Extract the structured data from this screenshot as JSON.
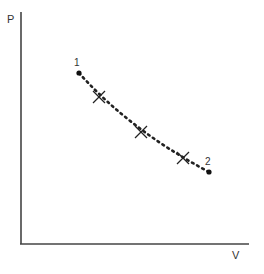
{
  "diagram": {
    "type": "PV diagram",
    "y_axis_label": "P",
    "x_axis_label": "V",
    "points": [
      {
        "label": "1",
        "x": 79,
        "y": 73
      },
      {
        "label": "2",
        "x": 209,
        "y": 172
      }
    ],
    "markers": [
      {
        "x": 99,
        "y": 97
      },
      {
        "x": 141,
        "y": 132
      },
      {
        "x": 183,
        "y": 158
      }
    ],
    "curve_style": "dotted",
    "colors": {
      "axis": "#333333",
      "curve": "#222222"
    }
  }
}
